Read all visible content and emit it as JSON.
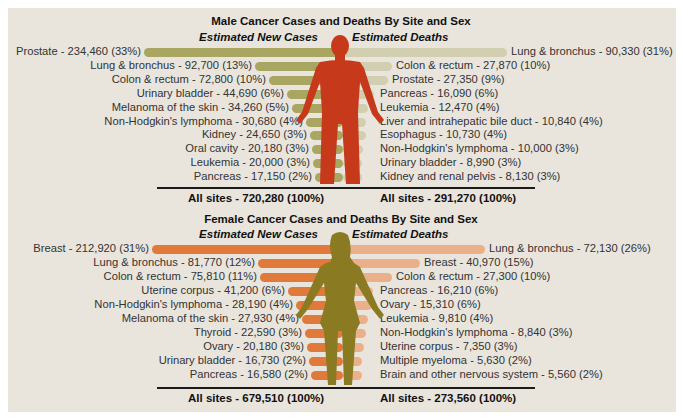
{
  "colors": {
    "panel_bg": "#e9e5dd",
    "male_cases_bar": "#a8a660",
    "male_deaths_bar": "#d2ceb0",
    "male_figure": "#c7391b",
    "female_cases_bar": "#e07a3a",
    "female_deaths_bar": "#eab08a",
    "female_figure": "#8a7a22"
  },
  "male": {
    "title": "Male Cancer Cases and Deaths By Site and Sex",
    "cases_header": "Estimated New Cases",
    "deaths_header": "Estimated Deaths",
    "cases": [
      {
        "label": "Prostate - 234,460 (33%)"
      },
      {
        "label": "Lung & bronchus - 92,700 (13%)"
      },
      {
        "label": "Colon & rectum - 72,800 (10%)"
      },
      {
        "label": "Urinary bladder - 44,690 (6%)"
      },
      {
        "label": "Melanoma of the skin - 34,260 (5%)"
      },
      {
        "label": "Non-Hodgkin's lymphoma - 30,680 (4%)"
      },
      {
        "label": "Kidney - 24,650 (3%)"
      },
      {
        "label": "Oral cavity - 20,180 (3%)"
      },
      {
        "label": "Leukemia - 20,000 (3%)"
      },
      {
        "label": "Pancreas - 17,150 (2%)"
      }
    ],
    "deaths": [
      {
        "label": "Lung & bronchus - 90,330 (31%)"
      },
      {
        "label": "Colon & rectum - 27,870 (10%)"
      },
      {
        "label": "Prostate - 27,350 (9%)"
      },
      {
        "label": "Pancreas - 16,090 (6%)"
      },
      {
        "label": "Leukemia - 12,470 (4%)"
      },
      {
        "label": "Liver and intrahepatic bile duct - 10,840 (4%)"
      },
      {
        "label": "Esophagus - 10,730 (4%)"
      },
      {
        "label": "Non-Hodgkin's lymphoma - 10,000 (3%)"
      },
      {
        "label": "Urinary bladder - 8,990 (3%)"
      },
      {
        "label": "Kidney and renal pelvis - 8,130 (3%)"
      }
    ],
    "cases_total": "All sites - 720,280 (100%)",
    "deaths_total": "All sites - 291,270 (100%)"
  },
  "female": {
    "title": "Female Cancer Cases and Deaths By Site and Sex",
    "cases_header": "Estimated New Cases",
    "deaths_header": "Estimated Deaths",
    "cases": [
      {
        "label": "Breast - 212,920 (31%)"
      },
      {
        "label": "Lung & bronchus - 81,770 (12%)"
      },
      {
        "label": "Colon & rectum - 75,810 (11%)"
      },
      {
        "label": "Uterine corpus - 41,200 (6%)"
      },
      {
        "label": "Non-Hodgkin's lymphoma - 28,190 (4%)"
      },
      {
        "label": "Melanoma of the skin - 27,930 (4%)"
      },
      {
        "label": "Thyroid - 22,590 (3%)"
      },
      {
        "label": "Ovary - 20,180 (3%)"
      },
      {
        "label": "Urinary bladder - 16,730 (2%)"
      },
      {
        "label": "Pancreas - 16,580 (2%)"
      }
    ],
    "deaths": [
      {
        "label": "Lung & bronchus - 72,130 (26%)"
      },
      {
        "label": "Breast - 40,970 (15%)"
      },
      {
        "label": "Colon & rectum - 27,300 (10%)"
      },
      {
        "label": "Pancreas - 16,210 (6%)"
      },
      {
        "label": "Ovary - 15,310 (6%)"
      },
      {
        "label": "Leukemia - 9,810 (4%)"
      },
      {
        "label": "Non-Hodgkin's lymphoma - 8,840 (3%)"
      },
      {
        "label": "Uterine corpus - 7,350 (3%)"
      },
      {
        "label": "Multiple myeloma - 5,630 (2%)"
      },
      {
        "label": "Brain and other nervous system - 5,560 (2%)"
      }
    ],
    "cases_total": "All sites - 679,510 (100%)",
    "deaths_total": "All sites - 273,560 (100%)"
  },
  "chart_data": [
    {
      "type": "bar",
      "title": "Male Cancer Cases and Deaths By Site and Sex",
      "series": [
        {
          "name": "Estimated New Cases",
          "categories": [
            "Prostate",
            "Lung & bronchus",
            "Colon & rectum",
            "Urinary bladder",
            "Melanoma of the skin",
            "Non-Hodgkin's lymphoma",
            "Kidney",
            "Oral cavity",
            "Leukemia",
            "Pancreas"
          ],
          "values": [
            234460,
            92700,
            72800,
            44690,
            34260,
            30680,
            24650,
            20180,
            20000,
            17150
          ],
          "percent": [
            33,
            13,
            10,
            6,
            5,
            4,
            3,
            3,
            3,
            2
          ],
          "total": 720280
        },
        {
          "name": "Estimated Deaths",
          "categories": [
            "Lung & bronchus",
            "Colon & rectum",
            "Prostate",
            "Pancreas",
            "Leukemia",
            "Liver and intrahepatic bile duct",
            "Esophagus",
            "Non-Hodgkin's lymphoma",
            "Urinary bladder",
            "Kidney and renal pelvis"
          ],
          "values": [
            90330,
            27870,
            27350,
            16090,
            12470,
            10840,
            10730,
            10000,
            8990,
            8130
          ],
          "percent": [
            31,
            10,
            9,
            6,
            4,
            4,
            4,
            3,
            3,
            3
          ],
          "total": 291270
        }
      ],
      "orientation": "horizontal, diverging from central figure",
      "grid": false,
      "legend": "none (column headers)"
    },
    {
      "type": "bar",
      "title": "Female Cancer Cases and Deaths By Site and Sex",
      "series": [
        {
          "name": "Estimated New Cases",
          "categories": [
            "Breast",
            "Lung & bronchus",
            "Colon & rectum",
            "Uterine corpus",
            "Non-Hodgkin's lymphoma",
            "Melanoma of the skin",
            "Thyroid",
            "Ovary",
            "Urinary bladder",
            "Pancreas"
          ],
          "values": [
            212920,
            81770,
            75810,
            41200,
            28190,
            27930,
            22590,
            20180,
            16730,
            16580
          ],
          "percent": [
            31,
            12,
            11,
            6,
            4,
            4,
            3,
            3,
            2,
            2
          ],
          "total": 679510
        },
        {
          "name": "Estimated Deaths",
          "categories": [
            "Lung & bronchus",
            "Breast",
            "Colon & rectum",
            "Pancreas",
            "Ovary",
            "Leukemia",
            "Non-Hodgkin's lymphoma",
            "Uterine corpus",
            "Multiple myeloma",
            "Brain and other nervous system"
          ],
          "values": [
            72130,
            40970,
            27300,
            16210,
            15310,
            9810,
            8840,
            7350,
            5630,
            5560
          ],
          "percent": [
            26,
            15,
            10,
            6,
            6,
            4,
            3,
            3,
            2,
            2
          ],
          "total": 273560
        }
      ],
      "orientation": "horizontal, diverging from central figure",
      "grid": false,
      "legend": "none (column headers)"
    }
  ]
}
